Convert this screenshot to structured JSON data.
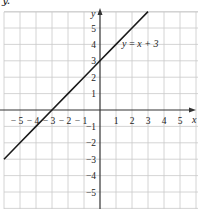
{
  "header_fragment": "y.",
  "chart_data": {
    "type": "line",
    "title": "",
    "xlabel": "x",
    "ylabel": "y",
    "xlim": [
      -6,
      6
    ],
    "ylim": [
      -6,
      6
    ],
    "grid": true,
    "x_ticks": [
      "-5",
      "-4",
      "-3",
      "-2",
      "-1",
      "1",
      "2",
      "3",
      "4",
      "5"
    ],
    "y_ticks": [
      "5",
      "4",
      "3",
      "2",
      "1",
      "-1",
      "-2",
      "-3",
      "-4",
      "-5"
    ],
    "series": [
      {
        "name": "y = x + 3",
        "label": "y = x + 3",
        "x": [
          -6,
          -5,
          -4,
          -3,
          -2,
          -1,
          0,
          1,
          2,
          3
        ],
        "values": [
          -3,
          -2,
          -1,
          0,
          1,
          2,
          3,
          4,
          5,
          6
        ],
        "color": "#1a1a1a"
      }
    ],
    "annotations": [
      {
        "text": "y = x + 3",
        "x": 1.5,
        "y": 4
      }
    ],
    "legend": "none"
  }
}
